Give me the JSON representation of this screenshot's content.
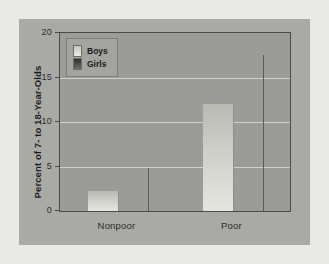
{
  "chart_data": {
    "type": "bar",
    "title": "",
    "xlabel": "",
    "ylabel": "Percent of 7- to 18-Year-Olds",
    "categories": [
      "Nonpoor",
      "Poor"
    ],
    "series": [
      {
        "name": "Boys",
        "values": [
          2.2,
          12.0
        ],
        "color": "#dcdcd6"
      },
      {
        "name": "Girls",
        "values": [
          4.8,
          17.5
        ],
        "color": "#4a4a47"
      }
    ],
    "ylim": [
      0,
      20
    ],
    "yticks": [
      0,
      5,
      10,
      15,
      20
    ],
    "ytick_labels": [
      "0",
      "5",
      "10",
      "15",
      "20"
    ],
    "grid": true,
    "legend_position": "top-left",
    "legend_entries": [
      "Boys",
      "Girls"
    ]
  },
  "figure": {
    "background": "#a9a9a6",
    "plot_background": "#9b9b98",
    "gridline_color": "#d9d9d4",
    "axis_color": "#4a4a48"
  }
}
